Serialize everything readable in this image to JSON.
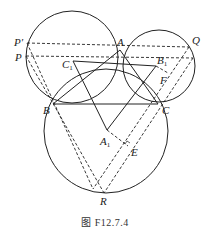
{
  "caption": "图 F12.7.4",
  "diagram": {
    "points": {
      "A": {
        "label": "A",
        "x": 120,
        "y": 50
      },
      "B": {
        "label": "B",
        "x": 53,
        "y": 104
      },
      "C": {
        "label": "C",
        "x": 158,
        "y": 104
      },
      "P_prime": {
        "label": "P′",
        "x": 27,
        "y": 43
      },
      "P": {
        "label": "P",
        "x": 26,
        "y": 56
      },
      "Q": {
        "label": "Q",
        "x": 189,
        "y": 47
      },
      "Q2": {
        "label": "",
        "x": 193,
        "y": 58
      },
      "C1": {
        "label": "C",
        "sub": "1",
        "x": 73,
        "y": 61
      },
      "B1": {
        "label": "B",
        "sub": "1",
        "x": 156,
        "y": 66
      },
      "A1": {
        "label": "A",
        "sub": "1",
        "x": 107,
        "y": 130
      },
      "E": {
        "label": "E",
        "x": 128,
        "y": 146
      },
      "F": {
        "label": "F",
        "x": 166,
        "y": 74
      },
      "R": {
        "label": "R",
        "x": 104,
        "y": 193
      },
      "R2": {
        "label": "",
        "x": 93,
        "y": 189
      }
    },
    "circles": [
      {
        "name": "circle-A1-center-C1",
        "cx": 72,
        "cy": 57,
        "r": 46
      },
      {
        "name": "circle-right-center-B1",
        "cx": 159,
        "cy": 66,
        "r": 36
      },
      {
        "name": "circle-bottom-center-A1",
        "cx": 106,
        "cy": 132,
        "r": 61
      }
    ]
  }
}
